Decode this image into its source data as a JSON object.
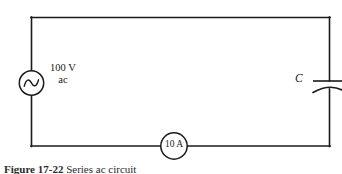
{
  "figure": {
    "caption_prefix": "Figure",
    "caption_number": "17-22",
    "caption_text": "Series ac circuit"
  },
  "circuit": {
    "source": {
      "icon": "ac-source-icon",
      "voltage": "100 V",
      "type": "ac"
    },
    "capacitor": {
      "icon": "capacitor-icon",
      "label": "C"
    },
    "ammeter": {
      "icon": "ammeter-icon",
      "reading": "10 A"
    },
    "wire": {
      "color": "#1a1a1a"
    }
  }
}
